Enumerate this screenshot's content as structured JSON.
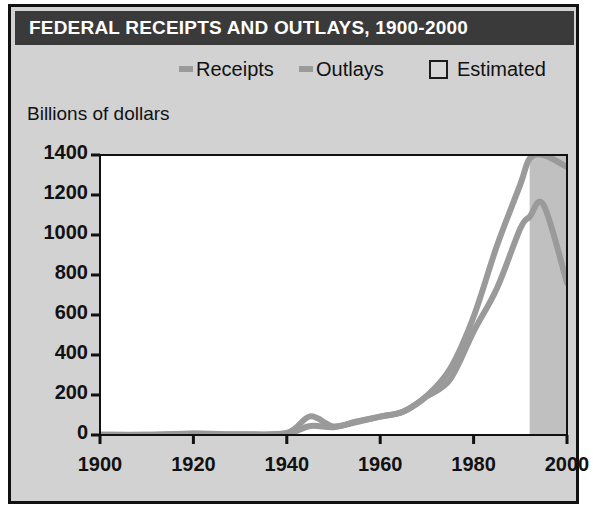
{
  "figure": {
    "title": "FEDERAL RECEIPTS AND OUTLAYS, 1900-2000",
    "y_axis_title": "Billions of dollars",
    "title_bar_color": "#3a3a3a",
    "panel_background": "#d2d2d2",
    "plot_background": "#ffffff",
    "estimated_band_color": "#c0c0c0",
    "line_color": "#9a9a9a"
  },
  "legend": {
    "items": [
      {
        "label": "Receipts",
        "marker": "line-swatch"
      },
      {
        "label": "Outlays",
        "marker": "line-swatch"
      },
      {
        "label": "Estimated",
        "marker": "box-swatch"
      }
    ]
  },
  "chart_data": {
    "type": "line",
    "title": "FEDERAL RECEIPTS AND OUTLAYS, 1900-2000",
    "xlabel": "",
    "ylabel": "Billions of dollars",
    "xlim": [
      1900,
      2000
    ],
    "ylim": [
      0,
      1400
    ],
    "ytick_labels": [
      "1400",
      "1200",
      "1000",
      "800",
      "600",
      "400",
      "200",
      "0"
    ],
    "ytick_values": [
      1400,
      1200,
      1000,
      800,
      600,
      400,
      200,
      0
    ],
    "xtick_labels": [
      "1900",
      "1920",
      "1940",
      "1960",
      "1980",
      "2000"
    ],
    "xtick_values": [
      1900,
      1920,
      1940,
      1960,
      1980,
      2000
    ],
    "grid": false,
    "legend_position": "top",
    "x": [
      1900,
      1910,
      1920,
      1930,
      1940,
      1945,
      1950,
      1955,
      1960,
      1965,
      1970,
      1975,
      1980,
      1985,
      1990,
      1992,
      1995,
      2000
    ],
    "series": [
      {
        "name": "Outlays",
        "values": [
          1,
          1,
          6,
          3,
          10,
          93,
          43,
          68,
          92,
          118,
          196,
          332,
          591,
          946,
          1253,
          1382,
          1520,
          1340
        ]
      },
      {
        "name": "Receipts",
        "values": [
          1,
          1,
          7,
          4,
          7,
          45,
          39,
          65,
          92,
          117,
          193,
          279,
          517,
          734,
          1032,
          1091,
          1150,
          760
        ]
      }
    ],
    "annotations": [
      {
        "type": "band",
        "label": "Estimated",
        "x_start": 1992,
        "x_end": 2000
      }
    ]
  }
}
